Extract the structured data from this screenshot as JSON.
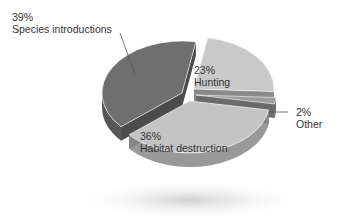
{
  "chart_data": {
    "type": "pie",
    "style": "3d-exploded",
    "title": "",
    "categories": [
      "Species introductions",
      "Hunting",
      "Other",
      "Habitat destruction"
    ],
    "values": [
      39,
      23,
      2,
      36
    ],
    "unit": "%",
    "colors": {
      "Species introductions": "#6f6f6f",
      "Hunting": "#c9c9c9",
      "Other": "#9c9c9c",
      "Habitat destruction": "#c4c4c4"
    },
    "legend": "none",
    "labels": [
      {
        "pct": "39%",
        "name": "Species introductions"
      },
      {
        "pct": "23%",
        "name": "Hunting"
      },
      {
        "pct": "2%",
        "name": "Other"
      },
      {
        "pct": "36%",
        "name": "Habitat destruction"
      }
    ]
  }
}
